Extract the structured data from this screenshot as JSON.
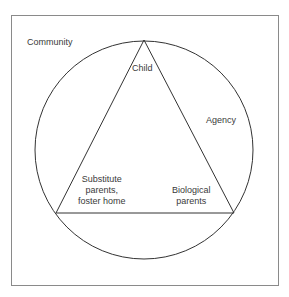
{
  "diagram": {
    "labels": {
      "community": "Community",
      "child": "Child",
      "agency": "Agency",
      "substitute": [
        "Substitute",
        "parents,",
        "foster home"
      ],
      "biological": [
        "Biological",
        "parents"
      ]
    },
    "colors": {
      "stroke": "#333333",
      "frame": "#8a8a8a"
    }
  }
}
